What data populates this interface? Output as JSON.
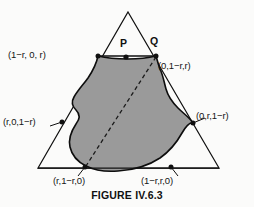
{
  "figure": {
    "caption": "FIGURE IV.6.3",
    "colors": {
      "background": "#fbfbfa",
      "stroke": "#101010",
      "region_fill": "#9a9a9a",
      "region_outline": "#0d0d0d",
      "dashed_line": "#1a1a1a",
      "label_text": "#151515"
    },
    "triangle": {
      "apex": [
        128,
        12
      ],
      "bottom_left": [
        38,
        168
      ],
      "bottom_right": [
        219,
        168
      ]
    },
    "vertex_labels": [
      {
        "id": "topleft",
        "text": "(1−r, 0, r)",
        "point": [
          98,
          56
        ]
      },
      {
        "id": "topright",
        "text": "(0,1−r,r)",
        "point": [
          156,
          56
        ]
      },
      {
        "id": "midleft",
        "text": "(r,0,1−r)",
        "point": [
          62,
          122
        ]
      },
      {
        "id": "midright",
        "text": "(0,r,1−r)",
        "point": [
          193,
          123
        ]
      },
      {
        "id": "botleft",
        "text": "(r,1−r,0)",
        "point": [
          85,
          168
        ]
      },
      {
        "id": "botright",
        "text": "(1−r,r,0)",
        "point": [
          171,
          168
        ]
      }
    ],
    "point_labels": [
      {
        "id": "p",
        "text": "P",
        "point": [
          126,
          56
        ]
      },
      {
        "id": "q",
        "text": "Q",
        "point": [
          156,
          56
        ]
      }
    ],
    "dashed_segment": {
      "from": [
        156,
        57
      ],
      "to": [
        86,
        166
      ]
    },
    "chord_segment": {
      "from": [
        98,
        56
      ],
      "to": [
        156,
        56
      ]
    }
  }
}
